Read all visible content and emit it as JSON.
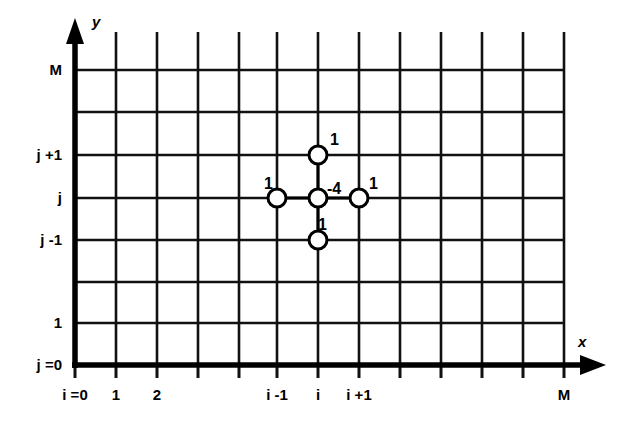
{
  "figure": {
    "axes": {
      "x_axis_label": "x",
      "y_axis_label": "y",
      "line_color": "#000000",
      "background": "#ffffff"
    },
    "x_ticks": [
      {
        "index": 0,
        "label": "i =0",
        "px": 75
      },
      {
        "index": 1,
        "label": "1",
        "px": 116
      },
      {
        "index": 2,
        "label": "2",
        "px": 157
      },
      {
        "index": 3,
        "label": "",
        "px": 198
      },
      {
        "index": 4,
        "label": "",
        "px": 239
      },
      {
        "index": 5,
        "label": "i -1",
        "px": 277
      },
      {
        "index": 6,
        "label": "i",
        "px": 318
      },
      {
        "index": 7,
        "label": "i +1",
        "px": 359
      },
      {
        "index": 8,
        "label": "",
        "px": 400
      },
      {
        "index": 9,
        "label": "",
        "px": 441
      },
      {
        "index": 10,
        "label": "",
        "px": 482
      },
      {
        "index": 11,
        "label": "",
        "px": 523
      },
      {
        "index": 12,
        "label": "M",
        "px": 564
      }
    ],
    "y_ticks": [
      {
        "index": 0,
        "label": "j =0",
        "px": 365
      },
      {
        "index": 1,
        "label": "1",
        "px": 323
      },
      {
        "index": 2,
        "label": "",
        "px": 282
      },
      {
        "index": 3,
        "label": "j -1",
        "px": 240
      },
      {
        "index": 4,
        "label": "j",
        "px": 198
      },
      {
        "index": 5,
        "label": "j +1",
        "px": 155
      },
      {
        "index": 6,
        "label": "",
        "px": 112
      },
      {
        "index": 7,
        "label": "M",
        "px": 70
      }
    ],
    "stencil": {
      "center": {
        "label": "-4",
        "cx": 318,
        "cy": 198,
        "label_x": 327,
        "label_y": 181,
        "label_align": "left"
      },
      "neighbors": [
        {
          "name": "north",
          "label": "1",
          "cx": 318,
          "cy": 155,
          "label_x": 330,
          "label_y": 132,
          "label_align": "left"
        },
        {
          "name": "west",
          "label": "1",
          "cx": 277,
          "cy": 198,
          "label_x": 264,
          "label_y": 176,
          "label_align": "left"
        },
        {
          "name": "east",
          "label": "1",
          "cx": 359,
          "cy": 198,
          "label_x": 369,
          "label_y": 176,
          "label_align": "left"
        },
        {
          "name": "south",
          "label": "1",
          "cx": 318,
          "cy": 240,
          "label_x": 318,
          "label_y": 217,
          "label_align": "left"
        }
      ],
      "node_radius": 9,
      "node_fill": "#ffffff",
      "node_stroke": "#000000"
    },
    "chart_data": {
      "type": "diagram",
      "title": "Five-point Laplacian difference stencil",
      "grid": {
        "x_min_px": 75,
        "x_max_px": 564,
        "y_min_px": 365,
        "y_max_px": 70,
        "columns": 12,
        "rows": 7,
        "spacing_px": 41,
        "grid_on": true
      },
      "stencil_weights": [
        {
          "position": "(i, j+1)",
          "value": 1
        },
        {
          "position": "(i-1, j)",
          "value": 1
        },
        {
          "position": "(i, j)",
          "value": -4
        },
        {
          "position": "(i+1, j)",
          "value": 1
        },
        {
          "position": "(i, j-1)",
          "value": 1
        }
      ],
      "xlabel": "x",
      "ylabel": "y",
      "xtick_labels": [
        "i =0",
        "1",
        "2",
        "",
        "",
        "i -1",
        "i",
        "i +1",
        "",
        "",
        "",
        "",
        "M"
      ],
      "ytick_labels": [
        "j =0",
        "1",
        "",
        "j -1",
        "j",
        "j +1",
        "",
        "M"
      ]
    }
  }
}
